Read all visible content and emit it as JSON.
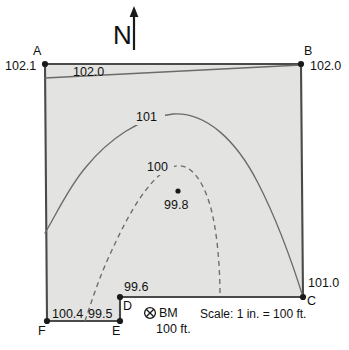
{
  "figure": {
    "type": "topographic-contour-map",
    "north_indicator": {
      "letter": "N",
      "arrow_icon": "north-arrow-icon"
    },
    "scale_note": "Scale: 1 in. = 100 ft.",
    "benchmark": {
      "symbol_icon": "benchmark-circle-x-icon",
      "label": "BM",
      "elevation": "100 ft."
    }
  },
  "vertices": [
    {
      "id": "A",
      "letter": "A",
      "elevation": "102.1",
      "x": 45,
      "y": 64
    },
    {
      "id": "B",
      "letter": "B",
      "elevation": "102.0",
      "x": 301,
      "y": 64
    },
    {
      "id": "C",
      "letter": "C",
      "elevation": "101.0",
      "x": 303,
      "y": 297
    },
    {
      "id": "D",
      "letter": "D",
      "elevation": "99.6",
      "x": 120,
      "y": 297
    },
    {
      "id": "E",
      "letter": "E",
      "elevation": "99.5",
      "x": 120,
      "y": 321
    },
    {
      "id": "F",
      "letter": "F",
      "elevation": "100.4",
      "x": 47,
      "y": 321
    }
  ],
  "spot_elevations": [
    {
      "value": "99.8",
      "x": 178,
      "y": 193
    }
  ],
  "contours": [
    {
      "label": "102.0",
      "style": "solid",
      "elevation": 102.0
    },
    {
      "label": "101",
      "style": "solid",
      "elevation": 101
    },
    {
      "label": "100",
      "style": "dashed",
      "elevation": 100
    }
  ],
  "colors": {
    "parcel_fill": "#e3e3e2",
    "boundary_line": "#4a4a4a",
    "contour_line": "#6b6b6b",
    "text": "#111111",
    "page_background": "#ffffff",
    "caption_text": "#8c8c8c"
  },
  "caption": ""
}
